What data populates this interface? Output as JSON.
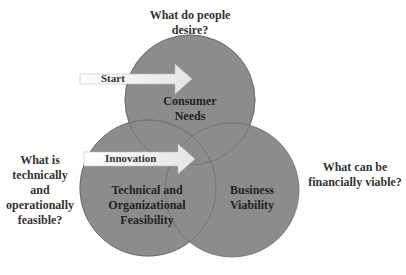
{
  "diagram": {
    "type": "venn",
    "circles": [
      {
        "id": "consumer-needs",
        "label_lines": [
          "Consumer",
          "Needs"
        ],
        "question_lines": [
          "What do people",
          "desire?"
        ]
      },
      {
        "id": "technical-feasibility",
        "label_lines": [
          "Technical and",
          "Organizational",
          "Feasibility"
        ],
        "question_lines": [
          "What is",
          "technically",
          "and",
          "operationally",
          "feasible?"
        ]
      },
      {
        "id": "business-viability",
        "label_lines": [
          "Business",
          "Viability"
        ],
        "question_lines": [
          "What can be",
          "financially viable?"
        ]
      }
    ],
    "arrows": [
      {
        "id": "start",
        "label": "Start"
      },
      {
        "id": "innovation",
        "label": "Innovation"
      }
    ],
    "colors": {
      "circle_fill": "#8c8c8c",
      "circle_stroke": "#6e6e6e",
      "arrow_fill": "#f2f2f2"
    }
  }
}
